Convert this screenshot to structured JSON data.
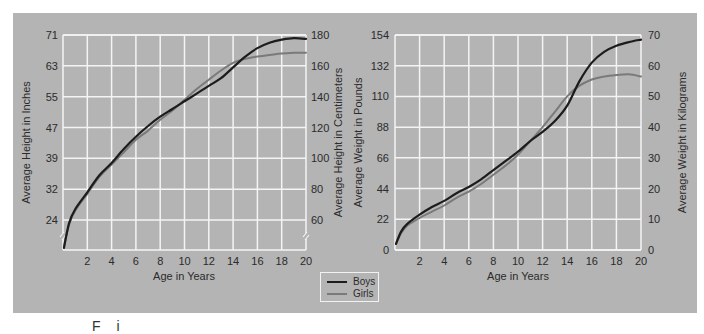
{
  "colors": {
    "panel": "#b4b4b4",
    "grid": "#f4f4f4",
    "boys": "#1c1c1c",
    "girls": "#7a7a7a",
    "text": "#2b2b2b"
  },
  "legend": {
    "items": [
      {
        "label": "Boys",
        "color": "#1c1c1c"
      },
      {
        "label": "Girls",
        "color": "#7a7a7a"
      }
    ]
  },
  "caption_fragment": "F  i",
  "chart_data": [
    {
      "type": "line",
      "title": "",
      "xlabel": "Age in  Years",
      "ylabel": "Average Height in Inches",
      "ylabel_right": "Average Height in Centimeters",
      "x_ticks": [
        2,
        4,
        6,
        8,
        10,
        12,
        14,
        16,
        18,
        20
      ],
      "xlim": [
        0,
        20
      ],
      "y_left_ticks": [
        "71",
        "63",
        "55",
        "47",
        "39",
        "32",
        "24"
      ],
      "y_right_ticks": [
        "180",
        "160",
        "140",
        "120",
        "100",
        "80",
        "60"
      ],
      "y_right_tick_values": [
        180,
        160,
        140,
        120,
        100,
        80,
        60
      ],
      "ylim": [
        40,
        180
      ],
      "axis_break": true,
      "grid": true,
      "legend_position": "bottom-center",
      "x": [
        0,
        0.5,
        1,
        2,
        3,
        4,
        5,
        6,
        7,
        8,
        9,
        10,
        11,
        12,
        13,
        14,
        15,
        16,
        17,
        18,
        19,
        20
      ],
      "series": [
        {
          "name": "Boys",
          "unit": "cm",
          "values": [
            42,
            58,
            67,
            78,
            89,
            97,
            106,
            114,
            121,
            127,
            132,
            137,
            142,
            147,
            152,
            159,
            166,
            171.5,
            175,
            177,
            178,
            177.5
          ]
        },
        {
          "name": "Girls",
          "unit": "cm",
          "values": [
            43,
            57,
            66,
            77,
            88,
            96,
            104,
            112,
            118,
            125,
            131,
            138,
            145,
            151,
            157,
            162,
            164.5,
            166,
            167,
            168,
            168.5,
            168.5
          ]
        }
      ]
    },
    {
      "type": "line",
      "title": "",
      "xlabel": "Age in  Years",
      "ylabel": "Average Weight in Pounds",
      "ylabel_right": "Average Weight in Kilograms",
      "x_ticks": [
        2,
        4,
        6,
        8,
        10,
        12,
        14,
        16,
        18,
        20
      ],
      "xlim": [
        0,
        20
      ],
      "y_left_ticks": [
        "154",
        "132",
        "110",
        "88",
        "66",
        "44",
        "22",
        "0"
      ],
      "y_right_ticks": [
        "70",
        "60",
        "50",
        "40",
        "30",
        "20",
        "10",
        "0"
      ],
      "y_right_tick_values": [
        70,
        60,
        50,
        40,
        30,
        20,
        10,
        0
      ],
      "ylim": [
        0,
        70
      ],
      "grid": true,
      "legend_position": "bottom-center",
      "x": [
        0,
        0.5,
        1,
        2,
        3,
        4,
        5,
        6,
        7,
        8,
        9,
        10,
        11,
        12,
        13,
        14,
        15,
        16,
        17,
        18,
        19,
        20
      ],
      "series": [
        {
          "name": "Boys",
          "unit": "kg",
          "values": [
            2,
            6,
            8.5,
            11.5,
            14,
            16,
            18.5,
            20.5,
            23,
            26,
            29,
            32,
            35.5,
            38.5,
            42,
            47,
            55,
            61,
            64.5,
            66.5,
            67.7,
            68.5
          ]
        },
        {
          "name": "Girls",
          "unit": "kg",
          "values": [
            2,
            5.5,
            8,
            10.5,
            12.5,
            14.5,
            17,
            19,
            21.5,
            24.5,
            27.5,
            31,
            35.5,
            40,
            45,
            50,
            53.5,
            55.5,
            56.5,
            57,
            57.2,
            56.5
          ]
        }
      ]
    }
  ]
}
